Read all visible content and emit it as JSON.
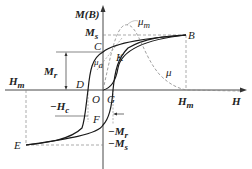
{
  "diagram": {
    "axes": {
      "y_label": "M(B)",
      "x_label": "H"
    },
    "points": {
      "B": "B",
      "C": "C",
      "D": "D",
      "E": "E",
      "F": "F",
      "G": "G",
      "K": "K",
      "O": "O"
    },
    "labels": {
      "Ms": "M",
      "Ms_sub": "s",
      "Mr": "M",
      "Mr_sub": "r",
      "Hm_right": "H",
      "Hm_right_sub": "m",
      "Hm_left": "H",
      "Hm_left_sub": "m",
      "neg_Hc": "−H",
      "neg_Hc_sub": "c",
      "neg_Mr": "−M",
      "neg_Mr_sub": "r",
      "neg_Ms": "−M",
      "neg_Ms_sub": "s",
      "mu_m": "μ",
      "mu_m_sub": "m",
      "mu_a": "μ",
      "mu_a_sub": "a",
      "mu": "μ"
    },
    "colors": {
      "curve": "#1a1a1a",
      "dashed": "#777777",
      "background": "#ffffff"
    }
  }
}
